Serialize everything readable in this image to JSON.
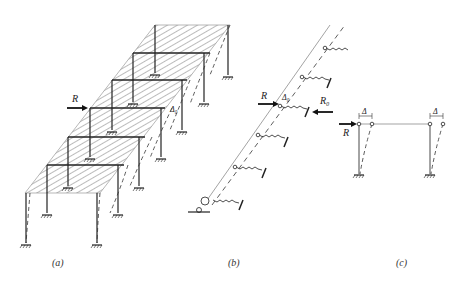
{
  "figure": {
    "panels": [
      {
        "id": "a",
        "caption": "(a)",
        "labels": {
          "force": "R",
          "displacement": "Δ₀"
        },
        "frame_count": 6
      },
      {
        "id": "b",
        "caption": "(b)",
        "labels": {
          "force": "R",
          "reaction": "R₀",
          "displacement": "Δ₀"
        },
        "spring_count": 6
      },
      {
        "id": "c",
        "caption": "(c)",
        "labels": {
          "force": "R",
          "disp_left": "Δ",
          "disp_right": "Δ"
        }
      }
    ]
  },
  "colors": {
    "line": "#222222",
    "hatch": "#555555",
    "light": "#999999",
    "background": "#ffffff"
  }
}
